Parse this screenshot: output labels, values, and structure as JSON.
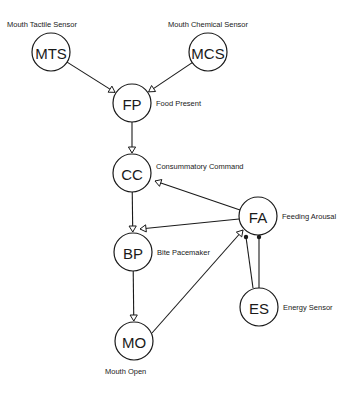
{
  "diagram": {
    "nodes": [
      {
        "id": "MTS",
        "abbr": "MTS",
        "label": "Mouth Tactile Sensor",
        "label_pos": "above"
      },
      {
        "id": "MCS",
        "abbr": "MCS",
        "label": "Mouth Chemical Sensor",
        "label_pos": "above"
      },
      {
        "id": "FP",
        "abbr": "FP",
        "label": "Food Present",
        "label_pos": "right"
      },
      {
        "id": "CC",
        "abbr": "CC",
        "label": "Consummatory Command",
        "label_pos": "right-top"
      },
      {
        "id": "FA",
        "abbr": "FA",
        "label": "Feeding Arousal",
        "label_pos": "right"
      },
      {
        "id": "BP",
        "abbr": "BP",
        "label": "Bite Pacemaker",
        "label_pos": "right"
      },
      {
        "id": "ES",
        "abbr": "ES",
        "label": "Energy Sensor",
        "label_pos": "right"
      },
      {
        "id": "MO",
        "abbr": "MO",
        "label": "Mouth Open",
        "label_pos": "below"
      }
    ],
    "edges": [
      {
        "from": "MTS",
        "to": "FP",
        "type": "excitatory"
      },
      {
        "from": "MCS",
        "to": "FP",
        "type": "excitatory"
      },
      {
        "from": "FP",
        "to": "CC",
        "type": "excitatory"
      },
      {
        "from": "FA",
        "to": "CC",
        "type": "excitatory"
      },
      {
        "from": "CC",
        "to": "BP",
        "type": "excitatory"
      },
      {
        "from": "FA",
        "to": "BP",
        "type": "excitatory"
      },
      {
        "from": "BP",
        "to": "MO",
        "type": "excitatory"
      },
      {
        "from": "MO",
        "to": "FA",
        "type": "excitatory"
      },
      {
        "from": "ES",
        "to": "FA",
        "type": "inhibitory"
      },
      {
        "from": "ES",
        "to": "FA",
        "type": "inhibitory"
      }
    ]
  }
}
